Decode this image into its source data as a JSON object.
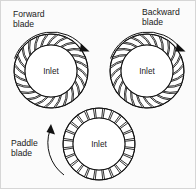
{
  "figure": {
    "background_color": "#fbfbfb",
    "border_color": "#d6d6d6",
    "line_color": "#111111",
    "text_color": "#1a1a1a"
  },
  "impellers": [
    {
      "id": "forward",
      "label": "Forward\nblade",
      "label_line1": "Forward",
      "label_line2": "blade",
      "inlet_label": "Inlet",
      "blade_type": "forward-curved",
      "blade_count": 24,
      "rotation": "clockwise",
      "center": {
        "x": 50,
        "y": 70
      },
      "outer_radius": 37,
      "inner_radius": 26
    },
    {
      "id": "backward",
      "label": "Backward\nblade",
      "label_line1": "Backward",
      "label_line2": "blade",
      "inlet_label": "Inlet",
      "blade_type": "backward-curved",
      "blade_count": 24,
      "rotation": "clockwise",
      "center": {
        "x": 146,
        "y": 70
      },
      "outer_radius": 37,
      "inner_radius": 26
    },
    {
      "id": "paddle",
      "label": "Paddle\nblade",
      "label_line1": "Paddle",
      "label_line2": "blade",
      "inlet_label": "Inlet",
      "blade_type": "straight-radial",
      "blade_count": 24,
      "rotation": "counter-clockwise",
      "center": {
        "x": 98,
        "y": 143
      },
      "outer_radius": 36,
      "inner_radius": 26
    }
  ]
}
